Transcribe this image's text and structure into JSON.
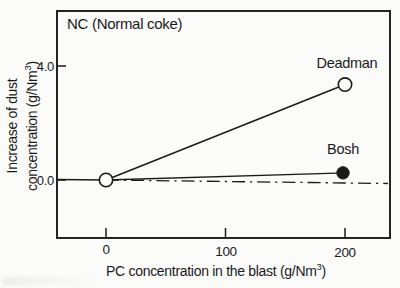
{
  "chart_data": {
    "type": "line",
    "title": "NC (Normal coke)",
    "xlabel": "PC concentration in the blast (g/Nm3)",
    "xlabel_parts": {
      "pre": "PC concentration in the blast (g/Nm",
      "sup": "3",
      "post": ")"
    },
    "ylabel": "Increase of dust concentration (g/Nm3)",
    "ylabel_parts": {
      "line1": "Increase of dust",
      "line2_pre": "concentration (g/Nm",
      "line2_sup": "3",
      "line2_post": ")"
    },
    "x_ticks": [
      0,
      100,
      200
    ],
    "x_tick_labels": [
      "0",
      "100",
      "200"
    ],
    "y_ticks": [
      0.0,
      4.0
    ],
    "y_tick_labels": [
      "0.0",
      "4.0"
    ],
    "xlim": [
      -41,
      237
    ],
    "ylim": [
      -2.0,
      5.9
    ],
    "grid": false,
    "legend_position": "inline-labels-at-endpoints",
    "reference_line": {
      "y": 0.0,
      "style": "dash-dot"
    },
    "series": [
      {
        "name": "Deadman",
        "marker": "open-circle",
        "points": [
          {
            "x": 0,
            "y": 0.0
          },
          {
            "x": 200,
            "y": 3.35
          }
        ]
      },
      {
        "name": "Bosh",
        "marker": "filled-circle",
        "points": [
          {
            "x": 0,
            "y": 0.0
          },
          {
            "x": 200,
            "y": 0.25
          }
        ]
      }
    ],
    "origin_marker": "open-circle",
    "colors": {
      "line": "#1a1a1a",
      "background": "#fbfbfa",
      "marker_fill_open": "#fbfbfa"
    }
  }
}
